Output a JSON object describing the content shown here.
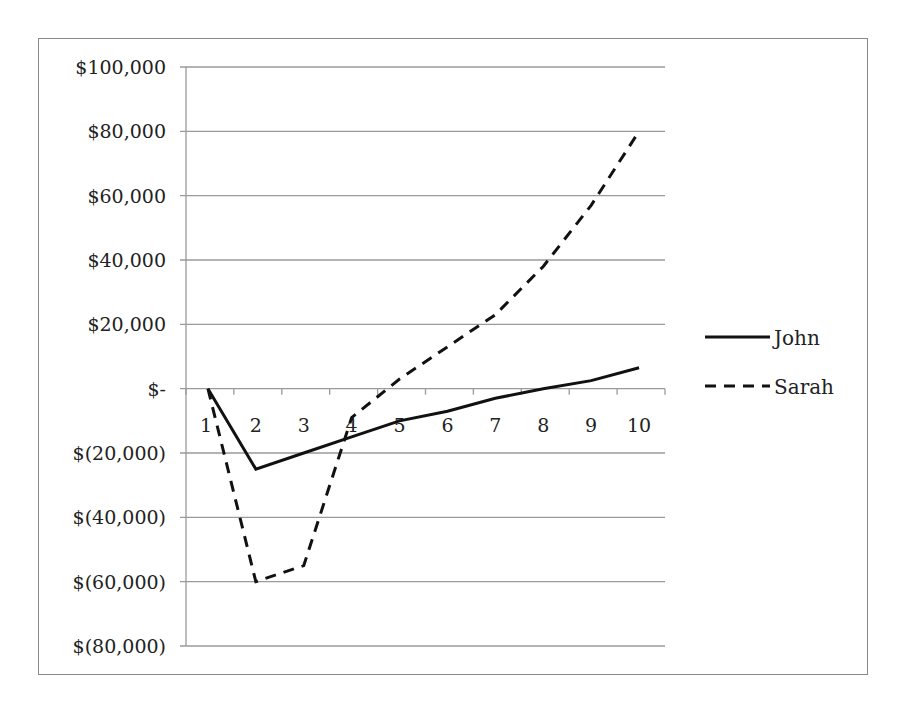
{
  "chart_data": {
    "type": "line",
    "title": "",
    "xlabel": "",
    "ylabel": "",
    "categories": [
      "1",
      "2",
      "3",
      "4",
      "5",
      "6",
      "7",
      "8",
      "9",
      "10"
    ],
    "series": [
      {
        "name": "John",
        "style": "solid",
        "values": [
          0,
          -25000,
          -20000,
          -15000,
          -10000,
          -7000,
          -3000,
          0,
          2500,
          6500
        ]
      },
      {
        "name": "Sarah",
        "style": "dashed",
        "values": [
          0,
          -60000,
          -55000,
          -9000,
          3000,
          13000,
          23000,
          38000,
          57000,
          80000
        ]
      }
    ],
    "y_ticks": [
      "$100,000",
      "$80,000",
      "$60,000",
      "$40,000",
      "$20,000",
      "$-",
      "$(20,000)",
      "$(40,000)",
      "$(60,000)",
      "$(80,000)"
    ],
    "ylim": [
      -80000,
      100000
    ],
    "grid": true,
    "legend_position": "right"
  },
  "legend": {
    "items": [
      {
        "label": "John"
      },
      {
        "label": "Sarah"
      }
    ]
  },
  "colors": {
    "line": "#111111",
    "grid": "#9a9a9a",
    "frame": "#8a8a8a"
  }
}
